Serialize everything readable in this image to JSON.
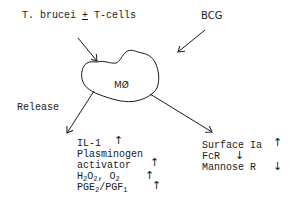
{
  "inputs": {
    "left": {
      "text_a": "T. brucei ",
      "symbol": "+",
      "text_b": " T-cells"
    },
    "right": {
      "text": "BCG"
    }
  },
  "center": {
    "label": "MØ"
  },
  "release": {
    "label": "Release",
    "items": [
      {
        "text": "IL-1",
        "change": "↑"
      },
      {
        "text": "Plasminogen",
        "change": ""
      },
      {
        "text": "activator",
        "change": "↑"
      },
      {
        "text_h": "H",
        "sub1": "2",
        "text_o": "O",
        "sub2": "2",
        "text_c": ", O",
        "sub3": "2",
        "sup3": "-",
        "change": "↑"
      },
      {
        "text_pge": "PGE",
        "sub1": "2",
        "text_pgf": "/PGF",
        "sub2": "1",
        "change": "↑"
      }
    ]
  },
  "surface": {
    "items": [
      {
        "text": "Surface Ia",
        "change": "↑"
      },
      {
        "text": "FcR",
        "change": "↓"
      },
      {
        "text": "Mannose R",
        "change": "↓"
      }
    ]
  },
  "colors": {
    "ink": "#1a1a1a",
    "background": "#ffffff"
  }
}
